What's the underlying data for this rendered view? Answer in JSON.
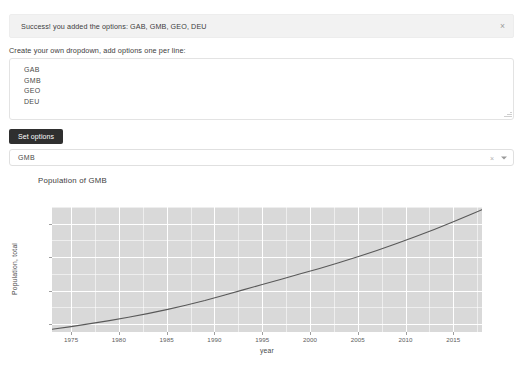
{
  "alert": {
    "message": "Success! you added the options: GAB, GMB, GEO, DEU",
    "close_label": "×",
    "background": "#f2f2f2"
  },
  "form": {
    "label": "Create your own dropdown, add options one per line:",
    "textarea_value": "GAB\nGMB\nGEO\nDEU",
    "textarea_placeholder": "",
    "submit_label": "Set options"
  },
  "dropdown": {
    "selected": "GMB",
    "clear_label": "×",
    "arrow_label": "▾",
    "options": [
      "GAB",
      "GMB",
      "GEO",
      "DEU"
    ]
  },
  "chart_data": {
    "type": "line",
    "title": "Population of GMB",
    "xlabel": "year",
    "ylabel": "Population, total",
    "xlim": [
      1973,
      2018
    ],
    "ylim": [
      380000,
      2250000
    ],
    "grid": true,
    "legend": "none",
    "xticks": [
      1975,
      1980,
      1985,
      1990,
      1995,
      2000,
      2005,
      2010,
      2015
    ],
    "xtick_labels": [
      "1975",
      "1980",
      "1985",
      "1990",
      "1995",
      "2000",
      "2005",
      "2010",
      "2015"
    ],
    "yticks": [
      500000,
      1000000,
      1500000,
      2000000
    ],
    "ytick_labels": [
      "0.5M",
      "1M",
      "1.5M",
      "2M"
    ],
    "series": [
      {
        "name": "Population, total",
        "color": "#595959",
        "x": [
          1973,
          1975,
          1977,
          1979,
          1981,
          1983,
          1985,
          1987,
          1989,
          1991,
          1993,
          1995,
          1997,
          1999,
          2001,
          2003,
          2005,
          2007,
          2009,
          2011,
          2013,
          2015,
          2017,
          2018
        ],
        "y": [
          420000,
          460000,
          505000,
          550000,
          600000,
          655000,
          715000,
          780000,
          850000,
          930000,
          1010000,
          1090000,
          1170000,
          1250000,
          1330000,
          1415000,
          1505000,
          1600000,
          1700000,
          1805000,
          1915000,
          2030000,
          2150000,
          2210000
        ]
      }
    ]
  }
}
